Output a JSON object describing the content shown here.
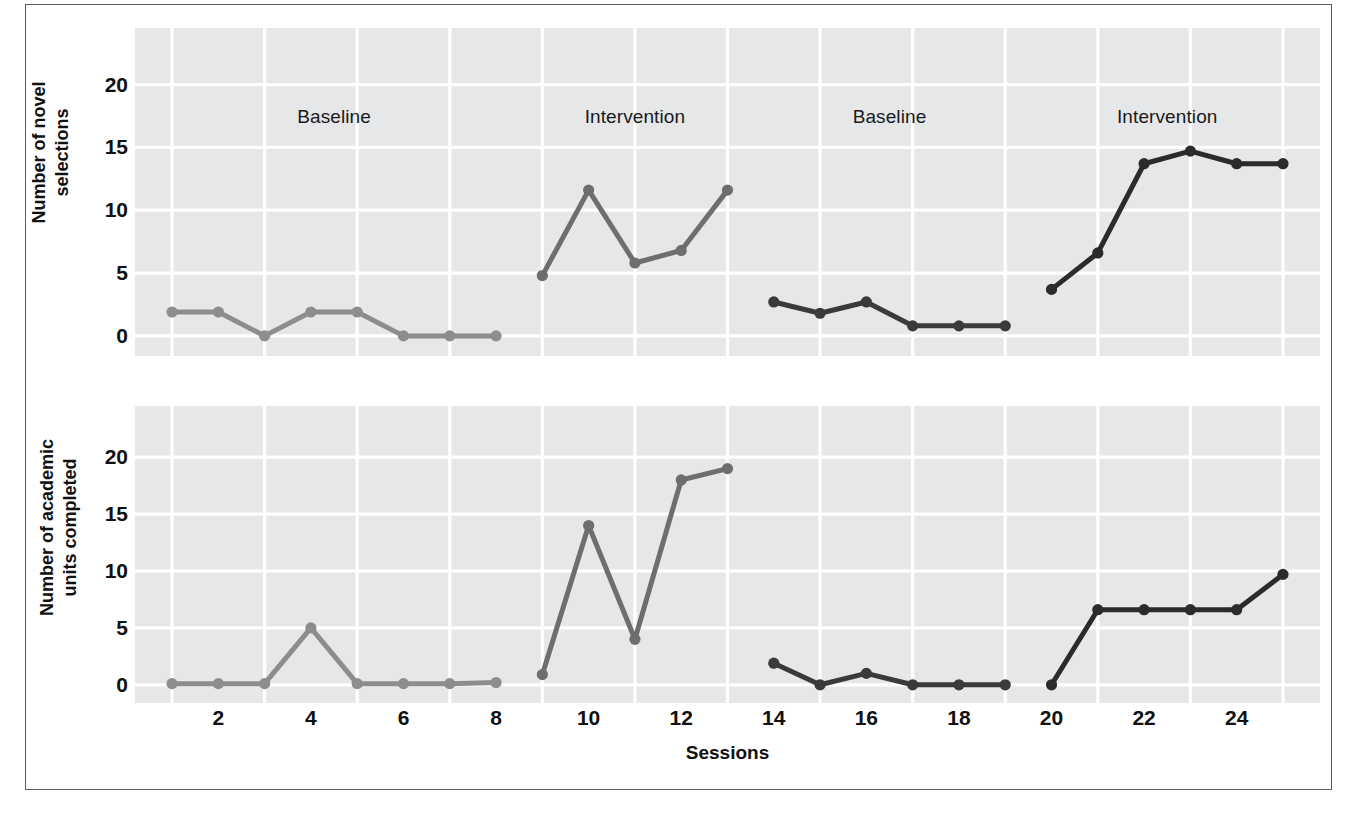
{
  "figure": {
    "frame_color": "#5b5b5b",
    "plot_background": "#e6e7e8",
    "gridline_color": "#ffffff"
  },
  "axis": {
    "x_label": "Sessions",
    "x_ticks": [
      2,
      4,
      6,
      8,
      10,
      12,
      14,
      16,
      18,
      20,
      22,
      24
    ],
    "x_min": 0.2,
    "x_max": 25.8,
    "y_ticks": [
      0,
      5,
      10,
      15,
      20
    ],
    "y_min": -1.6,
    "y_max": 24.5
  },
  "panels": [
    {
      "id": "top",
      "y_axis_label": "Number of novel\nselections",
      "phase_labels": [
        {
          "text": "Baseline",
          "session": 4.5
        },
        {
          "text": "Intervention",
          "session": 11.0
        },
        {
          "text": "Baseline",
          "session": 16.5
        },
        {
          "text": "Intervention",
          "session": 22.5
        }
      ]
    },
    {
      "id": "bottom",
      "y_axis_label": "Number of academic\nunits completed",
      "phase_labels": []
    }
  ],
  "chart_data": [
    {
      "type": "line",
      "title": "Number of novel selections",
      "xlabel": "Sessions",
      "ylabel": "Number of novel selections",
      "xlim": [
        0.2,
        25.8
      ],
      "ylim": [
        -1.6,
        24.5
      ],
      "grid": true,
      "legend": "none",
      "annotations": [
        "Baseline",
        "Intervention",
        "Baseline",
        "Intervention"
      ],
      "series": [
        {
          "name": "Baseline 1",
          "phase": "Baseline",
          "color": "#8d8d8d",
          "x": [
            1,
            2,
            3,
            4,
            5,
            6,
            7,
            8
          ],
          "values": [
            1.9,
            1.9,
            0.0,
            1.9,
            1.9,
            0.0,
            0.0,
            0.0
          ]
        },
        {
          "name": "Intervention 1",
          "phase": "Intervention",
          "color": "#6e6e6e",
          "x": [
            9,
            10,
            11,
            12,
            13
          ],
          "values": [
            4.8,
            11.6,
            5.8,
            6.8,
            11.6
          ]
        },
        {
          "name": "Baseline 2",
          "phase": "Baseline",
          "color": "#3a3a3a",
          "x": [
            14,
            15,
            16,
            17,
            18,
            19
          ],
          "values": [
            2.7,
            1.8,
            2.7,
            0.8,
            0.8,
            0.8
          ]
        },
        {
          "name": "Intervention 2",
          "phase": "Intervention",
          "color": "#2b2b2b",
          "x": [
            20,
            21,
            22,
            23,
            24,
            25
          ],
          "values": [
            3.7,
            6.6,
            13.7,
            14.7,
            13.7,
            13.7
          ]
        }
      ]
    },
    {
      "type": "line",
      "title": "Number of academic units completed",
      "xlabel": "Sessions",
      "ylabel": "Number of academic units completed",
      "xlim": [
        0.2,
        25.8
      ],
      "ylim": [
        -1.6,
        24.5
      ],
      "grid": true,
      "legend": "none",
      "annotations": [],
      "series": [
        {
          "name": "Baseline 1",
          "phase": "Baseline",
          "color": "#8d8d8d",
          "x": [
            1,
            2,
            3,
            4,
            5,
            6,
            7,
            8
          ],
          "values": [
            0.1,
            0.1,
            0.1,
            5.0,
            0.1,
            0.1,
            0.1,
            0.2
          ]
        },
        {
          "name": "Intervention 1",
          "phase": "Intervention",
          "color": "#6e6e6e",
          "x": [
            9,
            10,
            11,
            12,
            13
          ],
          "values": [
            0.9,
            14.0,
            4.0,
            18.0,
            19.0
          ]
        },
        {
          "name": "Baseline 2",
          "phase": "Baseline",
          "color": "#3a3a3a",
          "x": [
            14,
            15,
            16,
            17,
            18,
            19
          ],
          "values": [
            1.9,
            0.0,
            1.0,
            0.0,
            0.0,
            0.0
          ]
        },
        {
          "name": "Intervention 2",
          "phase": "Intervention",
          "color": "#2b2b2b",
          "x": [
            20,
            21,
            22,
            23,
            24,
            25
          ],
          "values": [
            0.0,
            6.6,
            6.6,
            6.6,
            6.6,
            9.7
          ]
        }
      ]
    }
  ]
}
